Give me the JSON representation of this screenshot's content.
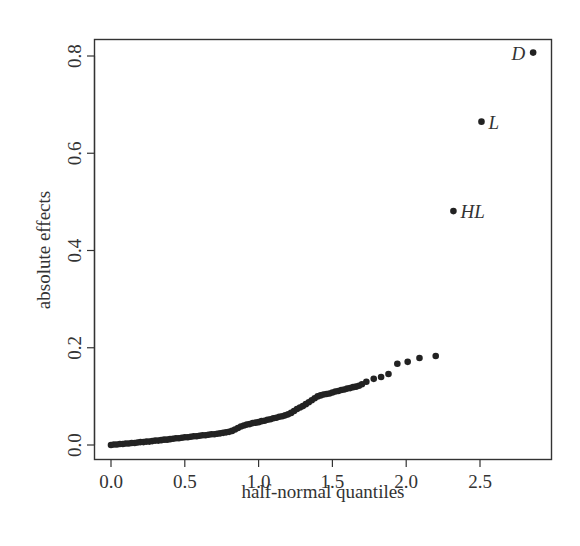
{
  "chart_data": {
    "type": "scatter",
    "title": "",
    "xlabel": "half-normal quantiles",
    "ylabel": "absolute effects",
    "xlim": [
      -0.11,
      2.98
    ],
    "ylim": [
      -0.028,
      0.836
    ],
    "xticks": [
      0.0,
      0.5,
      1.0,
      1.5,
      2.0,
      2.5
    ],
    "xtick_labels": [
      "0.0",
      "0.5",
      "1.0",
      "1.5",
      "2.0",
      "2.5"
    ],
    "yticks": [
      0.0,
      0.2,
      0.4,
      0.6,
      0.8
    ],
    "ytick_labels": [
      "0.0",
      "0.2",
      "0.4",
      "0.6",
      "0.8"
    ],
    "grid": false,
    "legend": null,
    "point_color": "#222222",
    "series": [
      {
        "name": "effects",
        "x": [
          0.0,
          0.02,
          0.04,
          0.06,
          0.08,
          0.1,
          0.12,
          0.14,
          0.16,
          0.18,
          0.2,
          0.22,
          0.24,
          0.26,
          0.28,
          0.3,
          0.32,
          0.34,
          0.36,
          0.38,
          0.4,
          0.42,
          0.44,
          0.46,
          0.48,
          0.5,
          0.52,
          0.54,
          0.56,
          0.58,
          0.6,
          0.62,
          0.64,
          0.66,
          0.68,
          0.7,
          0.72,
          0.74,
          0.76,
          0.78,
          0.8,
          0.82,
          0.84,
          0.86,
          0.88,
          0.9,
          0.92,
          0.94,
          0.96,
          0.98,
          1.0,
          1.02,
          1.04,
          1.06,
          1.08,
          1.1,
          1.12,
          1.14,
          1.16,
          1.18,
          1.2,
          1.22,
          1.24,
          1.26,
          1.28,
          1.3,
          1.32,
          1.34,
          1.36,
          1.38,
          1.4,
          1.42,
          1.44,
          1.46,
          1.48,
          1.5,
          1.52,
          1.54,
          1.56,
          1.58,
          1.6,
          1.62,
          1.64,
          1.66,
          1.68,
          1.7,
          1.73,
          1.78,
          1.83,
          1.88,
          1.94,
          2.01,
          2.09,
          2.2
        ],
        "y": [
          0.0,
          0.001,
          0.001,
          0.002,
          0.002,
          0.003,
          0.003,
          0.004,
          0.004,
          0.005,
          0.006,
          0.006,
          0.007,
          0.007,
          0.008,
          0.009,
          0.009,
          0.01,
          0.011,
          0.011,
          0.012,
          0.013,
          0.014,
          0.014,
          0.015,
          0.016,
          0.016,
          0.017,
          0.018,
          0.018,
          0.019,
          0.02,
          0.02,
          0.021,
          0.022,
          0.022,
          0.023,
          0.024,
          0.025,
          0.026,
          0.027,
          0.029,
          0.032,
          0.035,
          0.038,
          0.04,
          0.042,
          0.043,
          0.045,
          0.046,
          0.047,
          0.049,
          0.05,
          0.052,
          0.053,
          0.055,
          0.056,
          0.058,
          0.059,
          0.061,
          0.063,
          0.066,
          0.07,
          0.074,
          0.077,
          0.08,
          0.084,
          0.088,
          0.092,
          0.096,
          0.1,
          0.102,
          0.104,
          0.105,
          0.106,
          0.108,
          0.11,
          0.111,
          0.113,
          0.114,
          0.116,
          0.117,
          0.119,
          0.12,
          0.122,
          0.125,
          0.13,
          0.136,
          0.14,
          0.146,
          0.167,
          0.171,
          0.179,
          0.183
        ]
      },
      {
        "name": "labeled",
        "points": [
          {
            "label": "HL",
            "x": 2.32,
            "y": 0.481
          },
          {
            "label": "L",
            "x": 2.51,
            "y": 0.665
          },
          {
            "label": "D",
            "x": 2.86,
            "y": 0.807
          }
        ]
      }
    ]
  }
}
